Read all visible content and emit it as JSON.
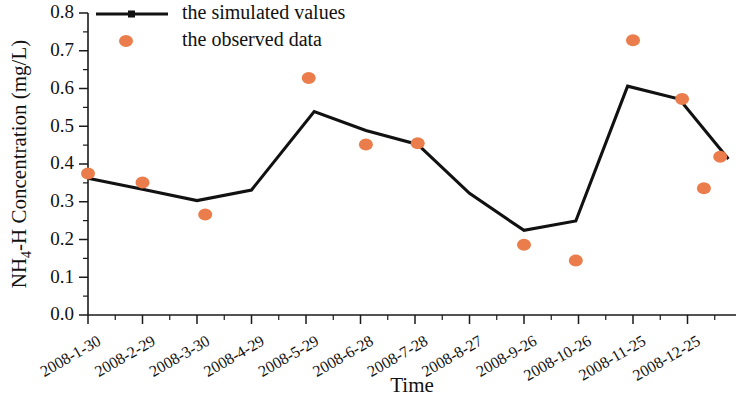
{
  "chart_data": {
    "type": "line",
    "title": "",
    "xlabel": "Time",
    "ylabel": "NH4-H Concentration (mg/L)",
    "ylabel_parts": {
      "prefix": "NH",
      "subscript": "4",
      "suffix": "-H Concentration (mg/L)"
    },
    "categories": [
      "2008-1-30",
      "2008-2-29",
      "2008-3-30",
      "2008-4-29",
      "2008-5-29",
      "2008-6-28",
      "2008-7-28",
      "2008-8-27",
      "2008-9-26",
      "2008-10-26",
      "2008-11-25",
      "2008-12-25"
    ],
    "ylim": [
      0.0,
      0.8
    ],
    "ytick_labels": [
      "0.0",
      "0.1",
      "0.2",
      "0.3",
      "0.4",
      "0.5",
      "0.6",
      "0.7",
      "0.8"
    ],
    "ytick_values": [
      0.0,
      0.1,
      0.2,
      0.3,
      0.4,
      0.5,
      0.6,
      0.7,
      0.8
    ],
    "ytick_minor_step": 0.05,
    "xtick_minor_count": 1,
    "grid": false,
    "legend_position": "top-left",
    "series": [
      {
        "name": "the simulated values",
        "kind": "line",
        "color": "#111111",
        "x": [
          0.0,
          1.0,
          2.0,
          3.0,
          4.15,
          5.1,
          6.05,
          7.0,
          8.0,
          8.95,
          9.9,
          10.85,
          11.75
        ],
        "values": [
          0.362,
          0.333,
          0.303,
          0.331,
          0.539,
          0.489,
          0.452,
          0.322,
          0.224,
          0.249,
          0.606,
          0.572,
          0.413
        ]
      },
      {
        "name": "the observed data",
        "kind": "scatter",
        "color": "#ea7d4b",
        "x": [
          0.0,
          1.0,
          2.15,
          4.05,
          5.1,
          6.05,
          8.0,
          8.95,
          10.0,
          10.9,
          11.3,
          11.6
        ],
        "values": [
          0.375,
          0.351,
          0.266,
          0.628,
          0.452,
          0.455,
          0.186,
          0.144,
          0.728,
          0.572,
          0.336,
          0.419
        ]
      }
    ],
    "data_points": {
      "simulated": [
        {
          "x_index": 0,
          "label": "2008-1-30",
          "value": 0.362
        },
        {
          "x_index": 1,
          "label": "2008-2-29",
          "value": 0.333
        },
        {
          "x_index": 2,
          "label": "2008-3-30",
          "value": 0.303
        },
        {
          "x_index": 3,
          "label": "2008-4-29",
          "value": 0.331
        },
        {
          "x_index": 4,
          "label": "2008-5-29",
          "value": 0.539
        },
        {
          "x_index": 5,
          "label": "2008-6-28",
          "value": 0.489
        },
        {
          "x_index": 6,
          "label": "2008-7-28",
          "value": 0.452
        },
        {
          "x_index": 7,
          "label": "2008-8-27",
          "value": 0.322
        },
        {
          "x_index": 8,
          "label": "2008-9-26",
          "value": 0.224
        },
        {
          "x_index": 9,
          "label": "2008-10-26",
          "value": 0.249
        },
        {
          "x_index": 10,
          "label": "2008-11-25",
          "value": 0.606
        },
        {
          "x_index": 11,
          "label": "2008-12-25",
          "value": 0.572
        }
      ],
      "observed": [
        {
          "x_index": 0,
          "label": "2008-1-30",
          "value": 0.375
        },
        {
          "x_index": 1,
          "label": "2008-2-29",
          "value": 0.351
        },
        {
          "x_index": 2,
          "label": "2008-3-30",
          "value": 0.266
        },
        {
          "x_index": 4,
          "label": "2008-5-29",
          "value": 0.628
        },
        {
          "x_index": 5,
          "label": "2008-6-28",
          "value": 0.452
        },
        {
          "x_index": 6,
          "label": "2008-7-28",
          "value": 0.455
        },
        {
          "x_index": 8,
          "label": "2008-9-26",
          "value": 0.186
        },
        {
          "x_index": 9,
          "label": "2008-10-26",
          "value": 0.144
        },
        {
          "x_index": 10,
          "label": "2008-11-25",
          "value": 0.728
        },
        {
          "x_index": 11,
          "label": "2008-12-25",
          "value": 0.572
        }
      ]
    }
  },
  "legend": {
    "items": [
      {
        "label": "the simulated values",
        "marker": "line-with-square",
        "color": "#111111"
      },
      {
        "label": "the observed data",
        "marker": "circle",
        "color": "#ea7d4b"
      }
    ]
  },
  "colors": {
    "observed": "#ea7d4b",
    "simulated": "#111111",
    "axis": "#1a1a1a",
    "background": "#ffffff"
  }
}
